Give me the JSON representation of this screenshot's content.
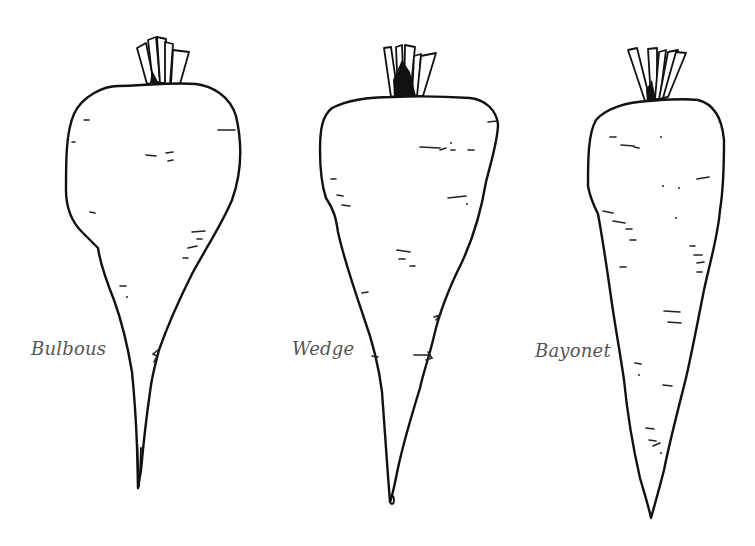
{
  "figure": {
    "background_color": "#ffffff",
    "line_color": "#111111",
    "label_color": "#555555"
  },
  "roots": [
    {
      "id": "bulbous",
      "label": "Bulbous"
    },
    {
      "id": "wedge",
      "label": "Wedge"
    },
    {
      "id": "bayonet",
      "label": "Bayonet"
    }
  ]
}
